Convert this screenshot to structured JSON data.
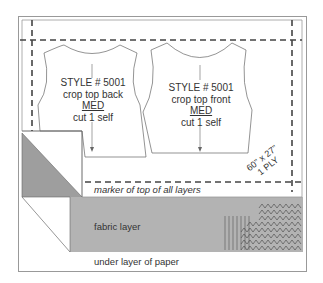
{
  "diagram": {
    "pattern_back": {
      "style": "STYLE # 5001",
      "name": "crop top back",
      "size": "MED",
      "cut": "cut 1 self"
    },
    "pattern_front": {
      "style": "STYLE # 5001",
      "name": "crop top front",
      "size": "MED",
      "cut": "cut 1 self"
    },
    "marker_dims": "60\" x 27\"",
    "ply": "1 PLY",
    "marker_label": "marker of top of all layers",
    "fabric_label": "fabric layer",
    "paper_label": "under layer of paper",
    "colors": {
      "line": "#555555",
      "fabric": "#b3b3b3",
      "fold": "#9a9a9a",
      "dash": "#444444"
    }
  }
}
